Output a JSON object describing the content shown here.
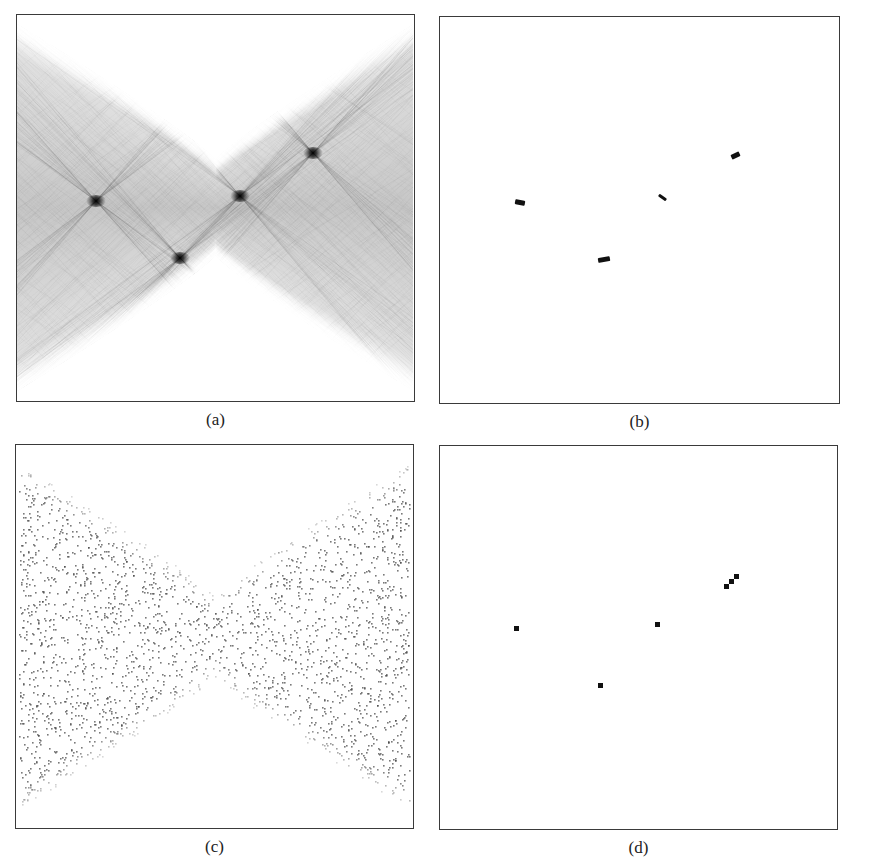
{
  "figure": {
    "panels": [
      {
        "id": "a",
        "caption": "(a)",
        "description": "Grayscale Hough accumulator with X-shaped envelope and four sharp peaks",
        "frame": {
          "x": 16,
          "y": 14,
          "w": 399,
          "h": 388
        },
        "peaks": [
          {
            "x": 79,
            "y": 186
          },
          {
            "x": 163,
            "y": 243
          },
          {
            "x": 223,
            "y": 181
          },
          {
            "x": 296,
            "y": 138
          }
        ]
      },
      {
        "id": "b",
        "caption": "(b)",
        "description": "Thresholded accumulator showing four small dark blobs",
        "frame": {
          "x": 439,
          "y": 16,
          "w": 401,
          "h": 388
        },
        "blobs": [
          {
            "x": 75,
            "y": 183,
            "w": 10,
            "h": 5,
            "rot": 10
          },
          {
            "x": 158,
            "y": 240,
            "w": 12,
            "h": 5,
            "rot": -10
          },
          {
            "x": 218,
            "y": 179,
            "w": 9,
            "h": 3,
            "rot": 35
          },
          {
            "x": 291,
            "y": 136,
            "w": 9,
            "h": 5,
            "rot": -25
          }
        ]
      },
      {
        "id": "c",
        "caption": "(c)",
        "description": "Scatter of sampled points forming an hourglass-shaped envelope",
        "frame": {
          "x": 15,
          "y": 444,
          "w": 399,
          "h": 385
        }
      },
      {
        "id": "d",
        "caption": "(d)",
        "description": "Detected peak locations shown as small square markers",
        "frame": {
          "x": 439,
          "y": 445,
          "w": 399,
          "h": 385
        },
        "markers": [
          {
            "x": 76,
            "y": 182
          },
          {
            "x": 160,
            "y": 239
          },
          {
            "x": 217,
            "y": 178
          },
          {
            "x": 286,
            "y": 140
          },
          {
            "x": 291,
            "y": 135
          },
          {
            "x": 296,
            "y": 130
          }
        ]
      }
    ]
  },
  "chart_data": [
    {
      "type": "heatmap",
      "title": "(a)",
      "xlabel": "",
      "ylabel": "",
      "grid": false,
      "peaks": [
        [
          79,
          186
        ],
        [
          163,
          243
        ],
        [
          223,
          181
        ],
        [
          296,
          138
        ]
      ],
      "colormap": "gray_r"
    },
    {
      "type": "heatmap",
      "title": "(b)",
      "xlabel": "",
      "ylabel": "",
      "grid": false,
      "blobs": [
        [
          80,
          185
        ],
        [
          164,
          242
        ],
        [
          222,
          180
        ],
        [
          296,
          138
        ]
      ]
    },
    {
      "type": "scatter",
      "title": "(c)",
      "xlabel": "",
      "ylabel": "",
      "grid": false,
      "note": "dense point cloud bounded by hourglass envelope (narrowest near center x)"
    },
    {
      "type": "scatter",
      "title": "(d)",
      "xlabel": "",
      "ylabel": "",
      "grid": false,
      "x": [
        76,
        160,
        217,
        286,
        291,
        296
      ],
      "y": [
        182,
        239,
        178,
        140,
        135,
        130
      ]
    }
  ]
}
